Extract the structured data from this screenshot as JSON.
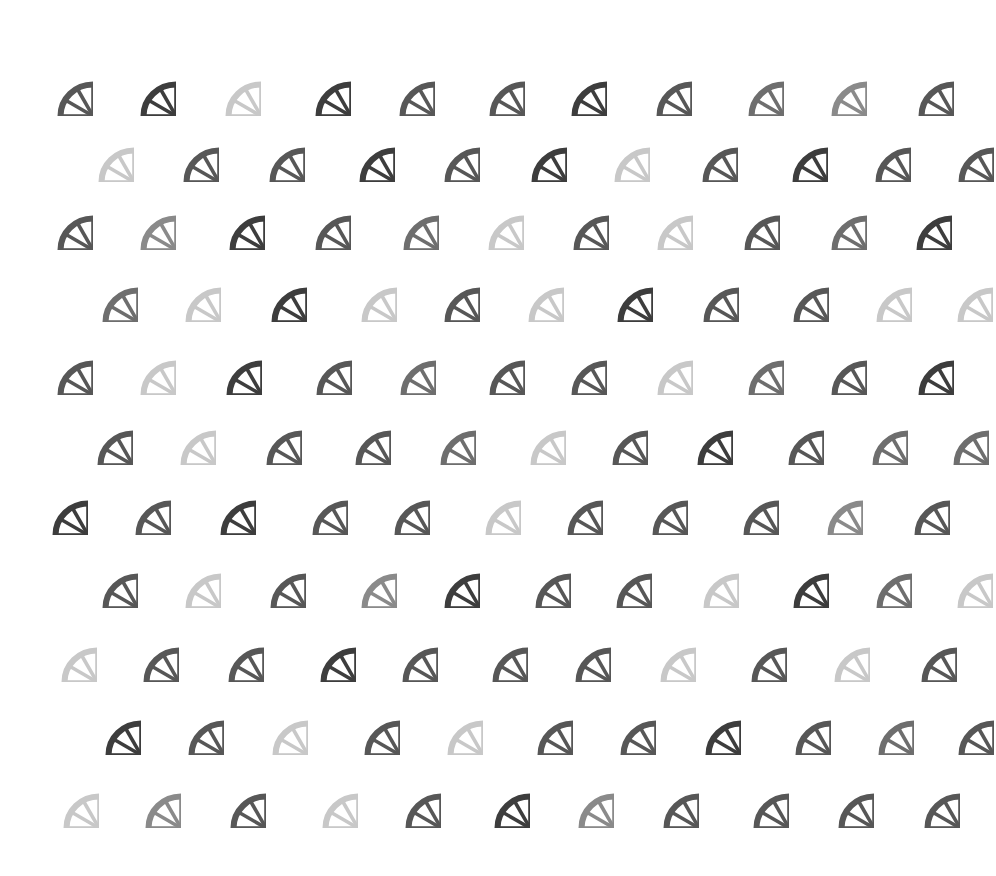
{
  "shades": {
    "D": "#3d3d3d",
    "M": "#575757",
    "G": "#6e6e6e",
    "H": "#8a8a8a",
    "L": "#c8c8c8"
  },
  "wheel": {
    "width": 72,
    "height": 70,
    "spokes": 12
  },
  "rows": [
    {
      "y": 81,
      "wheels": [
        [
          57,
          "M"
        ],
        [
          140,
          "D"
        ],
        [
          225,
          "L"
        ],
        [
          315,
          "D"
        ],
        [
          399,
          "M"
        ],
        [
          489,
          "M"
        ],
        [
          571,
          "D"
        ],
        [
          656,
          "M"
        ],
        [
          748,
          "G"
        ],
        [
          831,
          "H"
        ],
        [
          918,
          "M"
        ]
      ]
    },
    {
      "y": 147,
      "wheels": [
        [
          98,
          "L"
        ],
        [
          183,
          "M"
        ],
        [
          269,
          "M"
        ],
        [
          359,
          "D"
        ],
        [
          444,
          "M"
        ],
        [
          531,
          "D"
        ],
        [
          614,
          "L"
        ],
        [
          702,
          "M"
        ],
        [
          792,
          "D"
        ],
        [
          875,
          "M"
        ],
        [
          958,
          "M"
        ]
      ]
    },
    {
      "y": 215,
      "wheels": [
        [
          57,
          "M"
        ],
        [
          140,
          "H"
        ],
        [
          229,
          "D"
        ],
        [
          315,
          "M"
        ],
        [
          403,
          "G"
        ],
        [
          488,
          "L"
        ],
        [
          573,
          "M"
        ],
        [
          657,
          "L"
        ],
        [
          744,
          "M"
        ],
        [
          831,
          "G"
        ],
        [
          916,
          "D"
        ]
      ]
    },
    {
      "y": 287,
      "wheels": [
        [
          102,
          "G"
        ],
        [
          185,
          "L"
        ],
        [
          271,
          "D"
        ],
        [
          361,
          "L"
        ],
        [
          444,
          "M"
        ],
        [
          528,
          "L"
        ],
        [
          617,
          "D"
        ],
        [
          703,
          "M"
        ],
        [
          793,
          "M"
        ],
        [
          876,
          "L"
        ],
        [
          957,
          "L"
        ]
      ]
    },
    {
      "y": 360,
      "wheels": [
        [
          57,
          "M"
        ],
        [
          140,
          "L"
        ],
        [
          226,
          "D"
        ],
        [
          316,
          "M"
        ],
        [
          400,
          "G"
        ],
        [
          489,
          "M"
        ],
        [
          571,
          "M"
        ],
        [
          657,
          "L"
        ],
        [
          748,
          "G"
        ],
        [
          831,
          "M"
        ],
        [
          918,
          "D"
        ]
      ]
    },
    {
      "y": 430,
      "wheels": [
        [
          97,
          "M"
        ],
        [
          180,
          "L"
        ],
        [
          266,
          "M"
        ],
        [
          355,
          "M"
        ],
        [
          440,
          "G"
        ],
        [
          530,
          "L"
        ],
        [
          612,
          "M"
        ],
        [
          697,
          "D"
        ],
        [
          788,
          "M"
        ],
        [
          872,
          "G"
        ],
        [
          953,
          "G"
        ]
      ]
    },
    {
      "y": 500,
      "wheels": [
        [
          52,
          "D"
        ],
        [
          135,
          "M"
        ],
        [
          220,
          "D"
        ],
        [
          312,
          "M"
        ],
        [
          394,
          "M"
        ],
        [
          485,
          "L"
        ],
        [
          567,
          "M"
        ],
        [
          652,
          "M"
        ],
        [
          743,
          "M"
        ],
        [
          827,
          "H"
        ],
        [
          914,
          "M"
        ]
      ]
    },
    {
      "y": 573,
      "wheels": [
        [
          102,
          "M"
        ],
        [
          185,
          "L"
        ],
        [
          270,
          "M"
        ],
        [
          361,
          "H"
        ],
        [
          444,
          "D"
        ],
        [
          535,
          "M"
        ],
        [
          616,
          "M"
        ],
        [
          703,
          "L"
        ],
        [
          793,
          "D"
        ],
        [
          876,
          "G"
        ],
        [
          957,
          "L"
        ]
      ]
    },
    {
      "y": 647,
      "wheels": [
        [
          61,
          "L"
        ],
        [
          143,
          "M"
        ],
        [
          228,
          "M"
        ],
        [
          320,
          "D"
        ],
        [
          402,
          "M"
        ],
        [
          492,
          "M"
        ],
        [
          575,
          "M"
        ],
        [
          660,
          "L"
        ],
        [
          751,
          "M"
        ],
        [
          834,
          "L"
        ],
        [
          921,
          "M"
        ]
      ]
    },
    {
      "y": 720,
      "wheels": [
        [
          105,
          "D"
        ],
        [
          188,
          "M"
        ],
        [
          272,
          "L"
        ],
        [
          364,
          "M"
        ],
        [
          447,
          "L"
        ],
        [
          537,
          "M"
        ],
        [
          620,
          "M"
        ],
        [
          705,
          "D"
        ],
        [
          795,
          "M"
        ],
        [
          878,
          "G"
        ],
        [
          958,
          "M"
        ]
      ]
    },
    {
      "y": 793,
      "wheels": [
        [
          63,
          "L"
        ],
        [
          145,
          "H"
        ],
        [
          230,
          "M"
        ],
        [
          322,
          "L"
        ],
        [
          405,
          "M"
        ],
        [
          494,
          "D"
        ],
        [
          578,
          "H"
        ],
        [
          663,
          "M"
        ],
        [
          753,
          "M"
        ],
        [
          838,
          "M"
        ],
        [
          924,
          "M"
        ]
      ]
    }
  ]
}
